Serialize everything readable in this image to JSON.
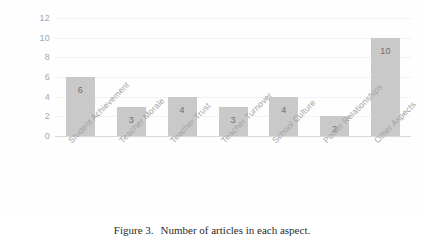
{
  "chart_data": {
    "type": "bar",
    "title": "",
    "xlabel": "",
    "ylabel": "",
    "categories": [
      "Student Achievement",
      "Teacher Morale",
      "Teacher Trust",
      "Teacher Turnover",
      "School Culture",
      "Power Relationships",
      "Other Aspects"
    ],
    "values": [
      6,
      3,
      4,
      3,
      4,
      2,
      10
    ],
    "value_labels": [
      "6",
      "3",
      "4",
      "3",
      "4",
      "2",
      "10"
    ],
    "ylim": [
      0,
      12
    ],
    "yticks": [
      0,
      2,
      4,
      6,
      8,
      10,
      12
    ],
    "ytick_labels": [
      "0",
      "2",
      "4",
      "6",
      "8",
      "10",
      "12"
    ],
    "grid": true,
    "legend": false,
    "bar_color": "#c9c9c9",
    "value_label_color": "#6e6e6e",
    "tick_label_color": "#a6a6a6",
    "category_label_color": "#a3a3a3",
    "axis_color": "#d9d9d9",
    "gridline_color": "#f2f2f2",
    "plot_background": "#fefefe"
  },
  "caption": {
    "number": "Figure 3.",
    "text": "Number of articles in each aspect."
  }
}
